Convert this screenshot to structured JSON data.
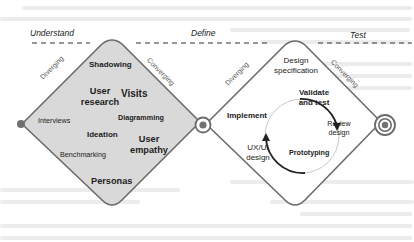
{
  "phases": {
    "understand": "Understand",
    "define": "Define",
    "test": "Test"
  },
  "left_diamond": {
    "edge_left": "Diverging",
    "edge_right": "Converging",
    "fill": "#d9d9d9",
    "items": [
      {
        "text": "Shadowing",
        "weight": "bold"
      },
      {
        "text": "User research",
        "weight": "bold"
      },
      {
        "text": "Visits",
        "weight": "bold"
      },
      {
        "text": "Interviews",
        "weight": "normal"
      },
      {
        "text": "Diagramming",
        "weight": "bold"
      },
      {
        "text": "Ideation",
        "weight": "bold"
      },
      {
        "text": "User empathy",
        "weight": "bold"
      },
      {
        "text": "Benchmarking",
        "weight": "normal"
      },
      {
        "text": "Personas",
        "weight": "bold"
      }
    ],
    "labels": {
      "shadowing": "Shadowing",
      "user_research_1": "User",
      "user_research_2": "research",
      "visits": "Visits",
      "interviews": "Interviews",
      "diagramming": "Diagramming",
      "ideation": "Ideation",
      "user_empathy_1": "User",
      "user_empathy_2": "empathy",
      "benchmarking": "Benchmarking",
      "personas": "Personas"
    }
  },
  "right_diamond": {
    "edge_left": "Diverging",
    "edge_right": "Converging",
    "fill": "#ffffff",
    "labels": {
      "design_spec_1": "Design",
      "design_spec_2": "specification",
      "validate_1": "Validate",
      "validate_2": "and test",
      "implement": "Implement",
      "review_1": "Review",
      "review_2": "design",
      "ux_1": "UX/UI",
      "ux_2": "design",
      "prototyping": "Prototyping"
    },
    "cycle": [
      "Validate and test",
      "Review design",
      "Prototyping"
    ]
  },
  "nodes": [
    {
      "name": "start",
      "style": "dot"
    },
    {
      "name": "middle",
      "style": "ring-dot"
    },
    {
      "name": "end",
      "style": "double-ring-dot"
    }
  ],
  "colors": {
    "line": "#6b6b6b",
    "node": "#707070",
    "dash": "#333333"
  }
}
